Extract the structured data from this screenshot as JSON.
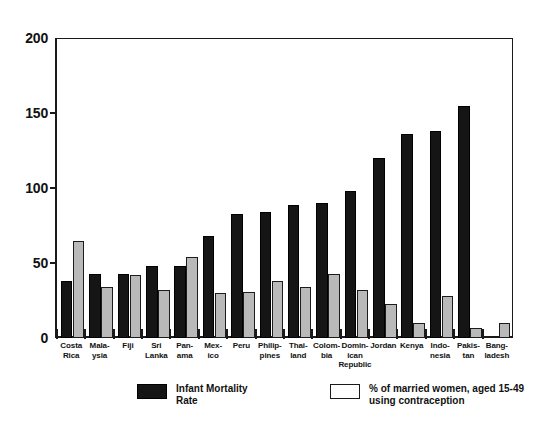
{
  "chart_data": {
    "type": "bar",
    "title": "",
    "xlabel": "",
    "ylabel": "",
    "ylim": [
      0,
      200
    ],
    "yticks": [
      0,
      50,
      100,
      150,
      200
    ],
    "ytick_labels": [
      "0",
      "50",
      "100",
      "150",
      "200"
    ],
    "grid": false,
    "legend_position": "bottom",
    "categories": [
      "Costa Rica",
      "Malaysia",
      "Fiji",
      "Sri Lanka",
      "Panama",
      "Mexico",
      "Peru",
      "Philippines",
      "Thailand",
      "Colombia",
      "Dominican Republic",
      "Jordan",
      "Kenya",
      "Indonesia",
      "Pakistan",
      "Bangladesh"
    ],
    "category_label_lines": [
      [
        "Costa",
        "Rica"
      ],
      [
        "Mala-",
        "ysia"
      ],
      [
        "Fiji"
      ],
      [
        "Sri",
        "Lanka"
      ],
      [
        "Pan-",
        "ama"
      ],
      [
        "Mex-",
        "ico"
      ],
      [
        "Peru"
      ],
      [
        "Philip-",
        "pines"
      ],
      [
        "Thai-",
        "land"
      ],
      [
        "Colom-",
        "bia"
      ],
      [
        "Domin-",
        "ican",
        "Republic"
      ],
      [
        "Jordan"
      ],
      [
        "Kenya"
      ],
      [
        "Indo-",
        "nesia"
      ],
      [
        "Pakis-",
        "tan"
      ],
      [
        "Bang-",
        "ladesh"
      ]
    ],
    "series": [
      {
        "name": "Infant Mortality Rate",
        "key": "imr",
        "color": "#151515",
        "values": [
          38,
          43,
          43,
          48,
          48,
          68,
          83,
          84,
          89,
          90,
          98,
          120,
          136,
          138,
          155,
          0
        ]
      },
      {
        "name": "% of married women, aged 15-49 using contraception",
        "key": "contra",
        "color": "#ffffff",
        "values": [
          65,
          34,
          42,
          32,
          54,
          30,
          31,
          38,
          34,
          43,
          32,
          23,
          10,
          28,
          7,
          10
        ]
      }
    ]
  },
  "axis": {
    "tick_labels": [
      "200",
      "150",
      "100",
      "50",
      "0"
    ]
  },
  "legend": {
    "entries": [
      {
        "swatch": "imr",
        "lines": [
          "Infant Mortality",
          "Rate"
        ]
      },
      {
        "swatch": "contra",
        "lines": [
          "% of married women, aged 15-49",
          "using contraception"
        ]
      }
    ]
  }
}
